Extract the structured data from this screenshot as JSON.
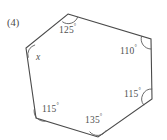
{
  "problem": {
    "number_label": "(4)",
    "unknown_variable": "x"
  },
  "figure": {
    "shape": "hexagon",
    "stroke_color": "#4a4a4a",
    "fill_color": "#ffffff",
    "vertices": [
      {
        "name": "top",
        "x": 68,
        "y": 14
      },
      {
        "name": "top-right",
        "x": 151,
        "y": 39
      },
      {
        "name": "bottom-right",
        "x": 152,
        "y": 99
      },
      {
        "name": "bottom",
        "x": 98,
        "y": 137
      },
      {
        "name": "bottom-left",
        "x": 36,
        "y": 118
      },
      {
        "name": "left",
        "x": 26,
        "y": 48
      }
    ]
  },
  "angles": [
    {
      "id": "top",
      "value": "125",
      "degree_symbol": "°",
      "label_x": 59,
      "label_y": 24
    },
    {
      "id": "top-right",
      "value": "110",
      "degree_symbol": "°",
      "label_x": 120,
      "label_y": 45
    },
    {
      "id": "bottom-right",
      "value": "115",
      "degree_symbol": "°",
      "label_x": 124,
      "label_y": 88
    },
    {
      "id": "bottom",
      "value": "135",
      "degree_symbol": "°",
      "label_x": 85,
      "label_y": 114
    },
    {
      "id": "bottom-left",
      "value": "115",
      "degree_symbol": "°",
      "label_x": 42,
      "label_y": 103
    },
    {
      "id": "left",
      "value": "x",
      "degree_symbol": "",
      "label_x": 36,
      "label_y": 53
    }
  ]
}
